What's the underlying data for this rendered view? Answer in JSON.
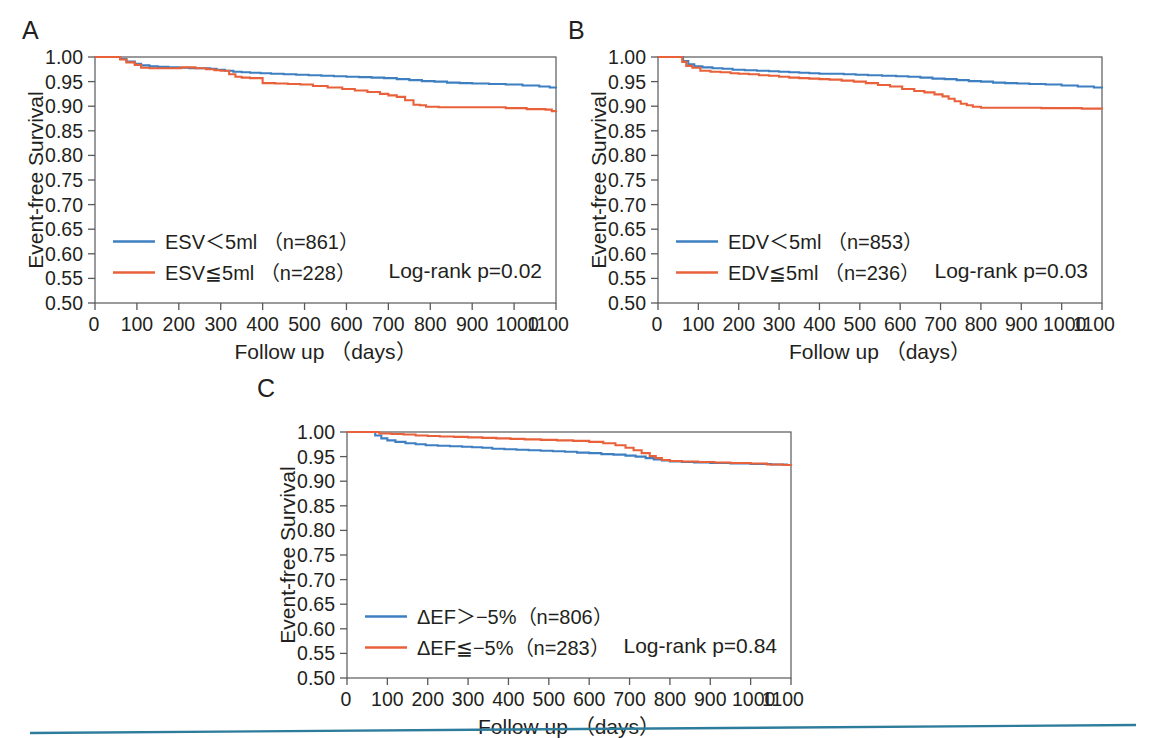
{
  "figure": {
    "background": "#ffffff",
    "panel_letters": [
      "A",
      "B",
      "C"
    ],
    "axis_color": "#58595b",
    "text_color": "#231f20",
    "rule_color": "#2e7c9c"
  },
  "chart_data": [
    {
      "id": "panel-a",
      "letter": "A",
      "type": "line",
      "title": "",
      "xlabel": "Follow up （days）",
      "ylabel": "Event-free Survival",
      "xlim": [
        0,
        1100
      ],
      "ylim": [
        0.5,
        1.0
      ],
      "xticks": [
        0,
        100,
        200,
        300,
        400,
        500,
        600,
        700,
        800,
        900,
        1000,
        1100
      ],
      "xticklabels": [
        "0",
        "100",
        "200",
        "300",
        "400",
        "500",
        "600",
        "700",
        "800",
        "900",
        "1000",
        "1100"
      ],
      "yticks": [
        0.5,
        0.55,
        0.6,
        0.65,
        0.7,
        0.75,
        0.8,
        0.85,
        0.9,
        0.95,
        1.0
      ],
      "yticklabels": [
        "0.50",
        "0.55",
        "0.60",
        "0.65",
        "0.70",
        "0.75",
        "0.80",
        "0.85",
        "0.90",
        "0.95",
        "1.00"
      ],
      "grid": false,
      "legend_position": "lower-left",
      "annotation": "Log-rank  p=0.02",
      "series": [
        {
          "name": "ESV＜5ml （n=861）",
          "color": "#3d7fc1",
          "n": 861,
          "x": [
            0,
            40,
            60,
            75,
            95,
            110,
            130,
            150,
            175,
            200,
            225,
            250,
            275,
            290,
            310,
            330,
            350,
            370,
            395,
            420,
            450,
            480,
            510,
            540,
            570,
            600,
            630,
            660,
            690,
            720,
            750,
            780,
            810,
            840,
            870,
            900,
            940,
            980,
            1020,
            1060,
            1085,
            1100
          ],
          "y": [
            1.0,
            1.0,
            0.996,
            0.991,
            0.986,
            0.983,
            0.981,
            0.98,
            0.979,
            0.978,
            0.977,
            0.977,
            0.976,
            0.974,
            0.972,
            0.97,
            0.969,
            0.968,
            0.967,
            0.966,
            0.965,
            0.964,
            0.963,
            0.962,
            0.961,
            0.96,
            0.959,
            0.958,
            0.957,
            0.955,
            0.953,
            0.951,
            0.95,
            0.948,
            0.947,
            0.946,
            0.945,
            0.944,
            0.942,
            0.94,
            0.938,
            0.936
          ]
        },
        {
          "name": "ESV≦5ml （n=228）",
          "color": "#e8613a",
          "n": 228,
          "x": [
            0,
            40,
            60,
            75,
            95,
            110,
            130,
            160,
            190,
            205,
            215,
            240,
            265,
            285,
            300,
            320,
            335,
            350,
            370,
            400,
            430,
            460,
            490,
            520,
            555,
            590,
            620,
            650,
            680,
            700,
            720,
            740,
            760,
            775,
            790,
            820,
            860,
            900,
            940,
            980,
            1030,
            1075,
            1090,
            1100
          ],
          "y": [
            1.0,
            1.0,
            0.995,
            0.989,
            0.984,
            0.978,
            0.977,
            0.977,
            0.977,
            0.979,
            0.979,
            0.977,
            0.975,
            0.973,
            0.972,
            0.965,
            0.96,
            0.958,
            0.957,
            0.947,
            0.946,
            0.945,
            0.944,
            0.941,
            0.938,
            0.935,
            0.932,
            0.929,
            0.925,
            0.922,
            0.919,
            0.912,
            0.903,
            0.902,
            0.899,
            0.898,
            0.898,
            0.898,
            0.898,
            0.896,
            0.894,
            0.893,
            0.89,
            0.888
          ]
        }
      ]
    },
    {
      "id": "panel-b",
      "letter": "B",
      "type": "line",
      "title": "",
      "xlabel": "Follow up （days）",
      "ylabel": "Event-free Survival",
      "xlim": [
        0,
        1100
      ],
      "ylim": [
        0.5,
        1.0
      ],
      "xticks": [
        0,
        100,
        200,
        300,
        400,
        500,
        600,
        700,
        800,
        900,
        1000,
        1100
      ],
      "xticklabels": [
        "0",
        "100",
        "200",
        "300",
        "400",
        "500",
        "600",
        "700",
        "800",
        "900",
        "1000",
        "1100"
      ],
      "yticks": [
        0.5,
        0.55,
        0.6,
        0.65,
        0.7,
        0.75,
        0.8,
        0.85,
        0.9,
        0.95,
        1.0
      ],
      "yticklabels": [
        "0.50",
        "0.55",
        "0.60",
        "0.65",
        "0.70",
        "0.75",
        "0.80",
        "0.85",
        "0.90",
        "0.95",
        "1.00"
      ],
      "grid": false,
      "legend_position": "lower-left",
      "annotation": "Log-rank  p=0.03",
      "series": [
        {
          "name": "EDV＜5ml （n=853）",
          "color": "#3d7fc1",
          "n": 853,
          "x": [
            0,
            50,
            62,
            75,
            90,
            110,
            135,
            160,
            185,
            215,
            245,
            275,
            300,
            325,
            350,
            375,
            400,
            430,
            460,
            490,
            520,
            555,
            590,
            620,
            650,
            680,
            710,
            740,
            770,
            800,
            830,
            860,
            890,
            920,
            960,
            1000,
            1040,
            1080,
            1100
          ],
          "y": [
            1.0,
            1.0,
            0.992,
            0.985,
            0.981,
            0.979,
            0.977,
            0.976,
            0.974,
            0.973,
            0.972,
            0.971,
            0.97,
            0.969,
            0.968,
            0.967,
            0.966,
            0.966,
            0.965,
            0.964,
            0.963,
            0.962,
            0.961,
            0.96,
            0.958,
            0.956,
            0.955,
            0.953,
            0.951,
            0.95,
            0.948,
            0.947,
            0.946,
            0.945,
            0.944,
            0.942,
            0.94,
            0.938,
            0.936
          ]
        },
        {
          "name": "EDV≦5ml （n=236）",
          "color": "#e8613a",
          "n": 236,
          "x": [
            0,
            50,
            60,
            70,
            85,
            105,
            130,
            155,
            180,
            200,
            225,
            250,
            275,
            300,
            325,
            350,
            375,
            400,
            425,
            455,
            485,
            515,
            545,
            575,
            605,
            635,
            660,
            685,
            705,
            720,
            735,
            750,
            765,
            780,
            800,
            830,
            870,
            910,
            950,
            1000,
            1050,
            1090,
            1100
          ],
          "y": [
            1.0,
            1.0,
            0.99,
            0.982,
            0.978,
            0.972,
            0.97,
            0.969,
            0.967,
            0.966,
            0.965,
            0.963,
            0.962,
            0.96,
            0.958,
            0.957,
            0.956,
            0.955,
            0.954,
            0.952,
            0.95,
            0.947,
            0.943,
            0.94,
            0.935,
            0.931,
            0.928,
            0.924,
            0.92,
            0.915,
            0.91,
            0.905,
            0.902,
            0.899,
            0.897,
            0.897,
            0.897,
            0.897,
            0.896,
            0.896,
            0.895,
            0.895,
            0.894
          ]
        }
      ]
    },
    {
      "id": "panel-c",
      "letter": "C",
      "type": "line",
      "title": "",
      "xlabel": "Follow up （days）",
      "ylabel": "Event-free Survival",
      "xlim": [
        0,
        1100
      ],
      "ylim": [
        0.5,
        1.0
      ],
      "xticks": [
        0,
        100,
        200,
        300,
        400,
        500,
        600,
        700,
        800,
        900,
        1000,
        1100
      ],
      "xticklabels": [
        "0",
        "100",
        "200",
        "300",
        "400",
        "500",
        "600",
        "700",
        "800",
        "900",
        "1000",
        "1100"
      ],
      "yticks": [
        0.5,
        0.55,
        0.6,
        0.65,
        0.7,
        0.75,
        0.8,
        0.85,
        0.9,
        0.95,
        1.0
      ],
      "yticklabels": [
        "0.50",
        "0.55",
        "0.60",
        "0.65",
        "0.70",
        "0.75",
        "0.80",
        "0.85",
        "0.90",
        "0.95",
        "1.00"
      ],
      "grid": false,
      "legend_position": "lower-left",
      "annotation": "Log-rank  p=0.84",
      "series": [
        {
          "name": "ΔEF＞−5%（n=806）",
          "color": "#3d7fc1",
          "n": 806,
          "x": [
            0,
            55,
            70,
            85,
            100,
            120,
            145,
            170,
            195,
            225,
            255,
            285,
            310,
            335,
            360,
            390,
            420,
            450,
            480,
            510,
            540,
            570,
            600,
            630,
            660,
            690,
            715,
            740,
            760,
            780,
            800,
            830,
            860,
            900,
            950,
            1000,
            1050,
            1090,
            1100
          ],
          "y": [
            1.0,
            1.0,
            0.993,
            0.987,
            0.983,
            0.98,
            0.977,
            0.975,
            0.973,
            0.972,
            0.971,
            0.97,
            0.969,
            0.968,
            0.966,
            0.965,
            0.964,
            0.963,
            0.962,
            0.961,
            0.96,
            0.958,
            0.957,
            0.955,
            0.954,
            0.952,
            0.95,
            0.947,
            0.944,
            0.942,
            0.94,
            0.939,
            0.938,
            0.937,
            0.936,
            0.935,
            0.934,
            0.933,
            0.932
          ]
        },
        {
          "name": "ΔEF≦−5%（n=283）",
          "color": "#e8613a",
          "n": 283,
          "x": [
            0,
            60,
            80,
            110,
            140,
            170,
            200,
            230,
            265,
            300,
            335,
            370,
            405,
            440,
            480,
            520,
            560,
            600,
            635,
            665,
            690,
            710,
            730,
            750,
            765,
            780,
            800,
            830,
            870,
            910,
            950,
            1000,
            1040,
            1080,
            1100
          ],
          "y": [
            1.0,
            1.0,
            0.997,
            0.996,
            0.995,
            0.993,
            0.992,
            0.991,
            0.99,
            0.989,
            0.988,
            0.987,
            0.986,
            0.985,
            0.984,
            0.983,
            0.982,
            0.98,
            0.977,
            0.973,
            0.968,
            0.963,
            0.957,
            0.951,
            0.947,
            0.943,
            0.941,
            0.94,
            0.939,
            0.938,
            0.937,
            0.936,
            0.934,
            0.933,
            0.932
          ]
        }
      ]
    }
  ]
}
